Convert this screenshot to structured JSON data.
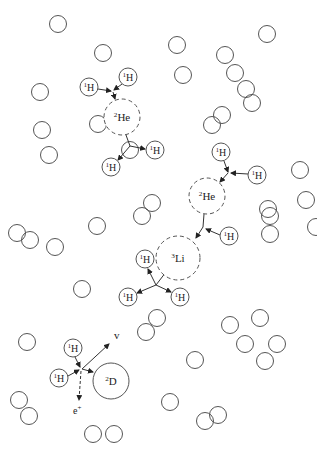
{
  "diagram": {
    "colors": {
      "stroke": "#555555",
      "text": "#222222",
      "background": "#ffffff"
    },
    "free_particles": [
      [
        58,
        24
      ],
      [
        103,
        53
      ],
      [
        267,
        34
      ],
      [
        177,
        45
      ],
      [
        40,
        92
      ],
      [
        225,
        55
      ],
      [
        183,
        75
      ],
      [
        235,
        73
      ],
      [
        246,
        89
      ],
      [
        42,
        130
      ],
      [
        49,
        155
      ],
      [
        222,
        115
      ],
      [
        212,
        125
      ],
      [
        252,
        103
      ],
      [
        130,
        150
      ],
      [
        98,
        124
      ],
      [
        306,
        200
      ],
      [
        17,
        233
      ],
      [
        30,
        240
      ],
      [
        55,
        247
      ],
      [
        97,
        226
      ],
      [
        82,
        289
      ],
      [
        270,
        216
      ],
      [
        270,
        234
      ],
      [
        268,
        209
      ],
      [
        146,
        332
      ],
      [
        157,
        318
      ],
      [
        230,
        325
      ],
      [
        260,
        318
      ],
      [
        277,
        344
      ],
      [
        245,
        344
      ],
      [
        265,
        361
      ],
      [
        19,
        400
      ],
      [
        29,
        416
      ],
      [
        93,
        434
      ],
      [
        114,
        434
      ],
      [
        195,
        360
      ],
      [
        205,
        421
      ],
      [
        218,
        415
      ],
      [
        170,
        402
      ],
      [
        316,
        227
      ],
      [
        152,
        203
      ],
      [
        142,
        216
      ],
      [
        27,
        342
      ],
      [
        300,
        170
      ]
    ],
    "reactions": [
      {
        "name": "helium-3-formation-top",
        "product": {
          "label_sup": "2",
          "label_el": "He",
          "x": 122,
          "y": 117,
          "r": 18,
          "style": "dashed"
        },
        "reactants": [
          {
            "label_sup": "1",
            "label_el": "H",
            "x": 89,
            "y": 87,
            "r": 9
          },
          {
            "label_sup": "1",
            "label_el": "H",
            "x": 128,
            "y": 77,
            "r": 9
          }
        ]
      },
      {
        "name": "helium-3-breakup-top",
        "products": [
          {
            "label_sup": "1",
            "label_el": "H",
            "x": 155,
            "y": 150,
            "r": 9
          },
          {
            "label_sup": "1",
            "label_el": "H",
            "x": 111,
            "y": 167,
            "r": 9
          }
        ]
      },
      {
        "name": "helium-3-formation-middle",
        "product": {
          "label_sup": "2",
          "label_el": "He",
          "x": 207,
          "y": 196,
          "r": 18,
          "style": "dashed"
        },
        "reactants": [
          {
            "label_sup": "1",
            "label_el": "H",
            "x": 221,
            "y": 152,
            "r": 9
          },
          {
            "label_sup": "1",
            "label_el": "H",
            "x": 257,
            "y": 175,
            "r": 9
          }
        ]
      },
      {
        "name": "lithium-formation",
        "product": {
          "label_sup": "3",
          "label_el": "Li",
          "x": 178,
          "y": 258,
          "r": 22,
          "style": "dashed"
        },
        "reactants": [
          {
            "label_sup": "1",
            "label_el": "H",
            "x": 229,
            "y": 236,
            "r": 9
          }
        ]
      },
      {
        "name": "lithium-breakup",
        "products": [
          {
            "label_sup": "1",
            "label_el": "H",
            "x": 145,
            "y": 259,
            "r": 9
          },
          {
            "label_sup": "1",
            "label_el": "H",
            "x": 128,
            "y": 297,
            "r": 9
          },
          {
            "label_sup": "1",
            "label_el": "H",
            "x": 180,
            "y": 297,
            "r": 9
          }
        ]
      },
      {
        "name": "deuterium-formation",
        "product": {
          "label_sup": "2",
          "label_el": "D",
          "x": 111,
          "y": 381,
          "r": 18,
          "style": "solid"
        },
        "reactants": [
          {
            "label_sup": "1",
            "label_el": "H",
            "x": 73,
            "y": 348,
            "r": 9
          },
          {
            "label_sup": "1",
            "label_el": "H",
            "x": 59,
            "y": 378,
            "r": 9
          }
        ],
        "emitted": [
          {
            "label": "v",
            "x": 118,
            "y": 335
          },
          {
            "label": "e⁺",
            "x": 77,
            "y": 410
          }
        ]
      }
    ],
    "labels": {
      "h": "H",
      "he": "He",
      "li": "Li",
      "d": "D",
      "one": "1",
      "two": "2",
      "three": "3",
      "neutrino": "v",
      "positron": "e",
      "positron_sup": "+"
    }
  }
}
